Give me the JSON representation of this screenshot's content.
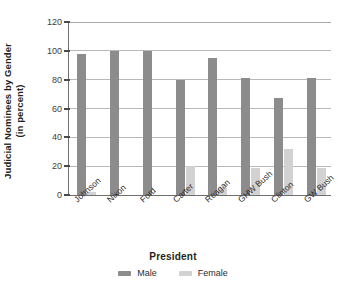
{
  "chart_data": {
    "type": "bar",
    "title": "",
    "subtitle": "",
    "xlabel": "President",
    "ylabel": "Judicial Nominees by Gender (in percent)",
    "ylabel_line1": "Judicial Nominees by Gender",
    "ylabel_line2": "(in percent)",
    "categories": [
      "Johnson",
      "Nixon",
      "Ford",
      "Carter",
      "Reagan",
      "GHW Bush",
      "Clinton",
      "GW Bush"
    ],
    "series": [
      {
        "name": "Male",
        "color": "#8c8c8c",
        "values": [
          98,
          100,
          100,
          80,
          95,
          81,
          67,
          81
        ]
      },
      {
        "name": "Female",
        "color": "#d2d2d2",
        "values": [
          2,
          0,
          0,
          20,
          5,
          19,
          32,
          19
        ]
      }
    ],
    "ylim": [
      0,
      120
    ],
    "yticks": [
      0,
      20,
      40,
      60,
      80,
      100,
      120
    ],
    "ytick_labels": [
      "0",
      "20",
      "40",
      "60",
      "80",
      "100",
      "120"
    ],
    "grid": "horizontal",
    "legend_position": "bottom-center",
    "xtick_rotation": -42
  },
  "legend": {
    "items": [
      {
        "label": "Male",
        "color": "#8c8c8c"
      },
      {
        "label": "Female",
        "color": "#d2d2d2"
      }
    ]
  },
  "colors": {
    "male": "#8c8c8c",
    "female": "#d2d2d2",
    "gridline": "#b9b9b9",
    "axis": "#6f6f6f",
    "text": "#231f20",
    "background": "#ffffff"
  }
}
